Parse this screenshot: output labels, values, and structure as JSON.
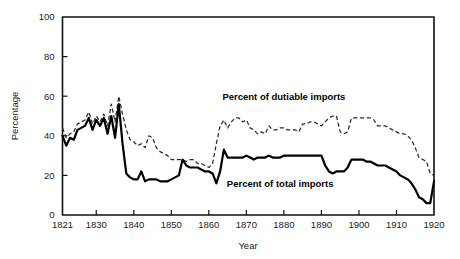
{
  "chart_data": {
    "type": "line",
    "title": "",
    "xlabel": "Year",
    "ylabel": "Percentage",
    "xlim": [
      1821,
      1920
    ],
    "ylim": [
      0,
      100
    ],
    "grid": false,
    "legend_position": "inline-annotations",
    "x_ticks": [
      "1821",
      "1830",
      "1840",
      "1850",
      "1860",
      "1870",
      "1880",
      "1890",
      "1900",
      "1910",
      "1920"
    ],
    "x_tick_values": [
      1821,
      1830,
      1840,
      1850,
      1860,
      1870,
      1880,
      1890,
      1900,
      1910,
      1920
    ],
    "y_ticks": [
      "0",
      "20",
      "40",
      "60",
      "80",
      "100"
    ],
    "y_tick_values": [
      0,
      20,
      40,
      60,
      80,
      100
    ],
    "annotations": [
      {
        "text": "Percent of dutiable imports",
        "x": 1880,
        "y": 58
      },
      {
        "text": "Percent of total imports",
        "x": 1879,
        "y": 14
      }
    ],
    "series": [
      {
        "name": "Percent of dutiable imports",
        "style": "dashed",
        "x": [
          1821,
          1822,
          1823,
          1824,
          1825,
          1826,
          1827,
          1828,
          1829,
          1830,
          1831,
          1832,
          1833,
          1834,
          1835,
          1836,
          1837,
          1838,
          1839,
          1840,
          1841,
          1842,
          1843,
          1844,
          1845,
          1846,
          1847,
          1848,
          1849,
          1850,
          1851,
          1852,
          1853,
          1854,
          1855,
          1856,
          1857,
          1858,
          1859,
          1860,
          1861,
          1862,
          1863,
          1864,
          1865,
          1866,
          1867,
          1868,
          1869,
          1870,
          1871,
          1872,
          1873,
          1874,
          1875,
          1876,
          1877,
          1878,
          1879,
          1880,
          1881,
          1882,
          1883,
          1884,
          1885,
          1886,
          1887,
          1888,
          1889,
          1890,
          1891,
          1892,
          1893,
          1894,
          1895,
          1896,
          1897,
          1898,
          1899,
          1900,
          1901,
          1902,
          1903,
          1904,
          1905,
          1906,
          1907,
          1908,
          1909,
          1910,
          1911,
          1912,
          1913,
          1914,
          1915,
          1916,
          1917,
          1918,
          1919,
          1920
        ],
        "values": [
          44,
          39,
          41,
          42,
          46,
          47,
          48,
          52,
          46,
          50,
          47,
          51,
          45,
          56,
          47,
          60,
          51,
          43,
          38,
          37,
          35,
          36,
          34,
          40,
          39,
          34,
          32,
          31,
          30,
          28,
          28,
          28,
          28,
          27,
          28,
          28,
          26,
          26,
          25,
          24,
          26,
          36,
          45,
          48,
          44,
          47,
          49,
          49,
          47,
          48,
          44,
          43,
          41,
          42,
          41,
          45,
          43,
          43,
          44,
          44,
          43,
          43,
          43,
          42,
          46,
          46,
          47,
          47,
          46,
          45,
          47,
          49,
          50,
          50,
          42,
          41,
          42,
          49,
          49,
          49,
          49,
          49,
          49,
          48,
          45,
          45,
          45,
          44,
          43,
          42,
          41,
          41,
          40,
          38,
          34,
          29,
          28,
          27,
          21,
          20
        ]
      },
      {
        "name": "Percent of total imports",
        "style": "solid",
        "x": [
          1821,
          1822,
          1823,
          1824,
          1825,
          1826,
          1827,
          1828,
          1829,
          1830,
          1831,
          1832,
          1833,
          1834,
          1835,
          1836,
          1837,
          1838,
          1839,
          1840,
          1841,
          1842,
          1843,
          1844,
          1845,
          1846,
          1847,
          1848,
          1849,
          1850,
          1851,
          1852,
          1853,
          1854,
          1855,
          1856,
          1857,
          1858,
          1859,
          1860,
          1861,
          1862,
          1863,
          1864,
          1865,
          1866,
          1867,
          1868,
          1869,
          1870,
          1871,
          1872,
          1873,
          1874,
          1875,
          1876,
          1877,
          1878,
          1879,
          1880,
          1881,
          1882,
          1883,
          1884,
          1885,
          1886,
          1887,
          1888,
          1889,
          1890,
          1891,
          1892,
          1893,
          1894,
          1895,
          1896,
          1897,
          1898,
          1899,
          1900,
          1901,
          1902,
          1903,
          1904,
          1905,
          1906,
          1907,
          1908,
          1909,
          1910,
          1911,
          1912,
          1913,
          1914,
          1915,
          1916,
          1917,
          1918,
          1919,
          1920
        ],
        "values": [
          40,
          35,
          39,
          38,
          43,
          44,
          45,
          49,
          43,
          48,
          45,
          49,
          41,
          50,
          39,
          56,
          36,
          21,
          19,
          18,
          18,
          22,
          17,
          18,
          18,
          18,
          17,
          17,
          17,
          18,
          19,
          20,
          28,
          25,
          24,
          24,
          24,
          23,
          22,
          22,
          21,
          16,
          22,
          33,
          29,
          29,
          29,
          29,
          29,
          30,
          29,
          28,
          29,
          29,
          29,
          30,
          29,
          29,
          29,
          30,
          30,
          30,
          30,
          30,
          30,
          30,
          30,
          30,
          30,
          30,
          25,
          22,
          21,
          22,
          22,
          22,
          24,
          28,
          28,
          28,
          28,
          27,
          27,
          26,
          25,
          25,
          25,
          24,
          23,
          22,
          20,
          19,
          18,
          16,
          13,
          9,
          8,
          6,
          6,
          17
        ]
      }
    ]
  },
  "axis": {
    "x_title": "Year",
    "y_title": "Percentage"
  }
}
